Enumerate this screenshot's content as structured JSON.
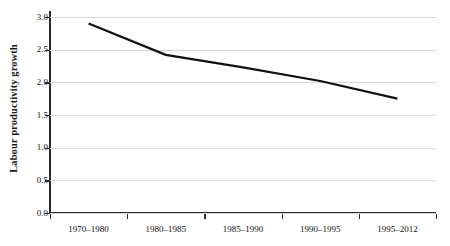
{
  "chart_data": {
    "type": "line",
    "title": "",
    "subtitle": "",
    "xlabel": "",
    "ylabel": "Labour productivity growth",
    "categories": [
      "1970–1980",
      "1980–1985",
      "1985–1990",
      "1990–1995",
      "1995–2012"
    ],
    "series": [
      {
        "name": "Labour productivity growth",
        "values": [
          2.9,
          2.42,
          2.23,
          2.02,
          1.75
        ],
        "color": "#111111"
      }
    ],
    "ylim": [
      0.0,
      3.0
    ],
    "yticks": [
      "0.0",
      "0.5",
      "1.0",
      "1.5",
      "2.0",
      "2.5",
      "3.0"
    ],
    "ytick_values": [
      0.0,
      0.5,
      1.0,
      1.5,
      2.0,
      2.5,
      3.0
    ],
    "grid": true,
    "grid_color": "#d9d9d9",
    "axis_color": "#2a2a2a",
    "legend": false,
    "legend_position": "none",
    "background": "#ffffff"
  }
}
